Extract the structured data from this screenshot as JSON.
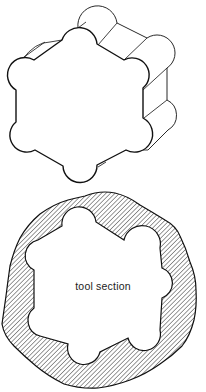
{
  "figure": {
    "top_drawing": {
      "description": "isometric extruded hexalobular tool"
    },
    "bottom_drawing": {
      "description": "cross-section of tool within hatched material",
      "label": "tool section"
    },
    "colors": {
      "line": "#111111",
      "background": "#ffffff",
      "hatch": "#333333"
    }
  }
}
